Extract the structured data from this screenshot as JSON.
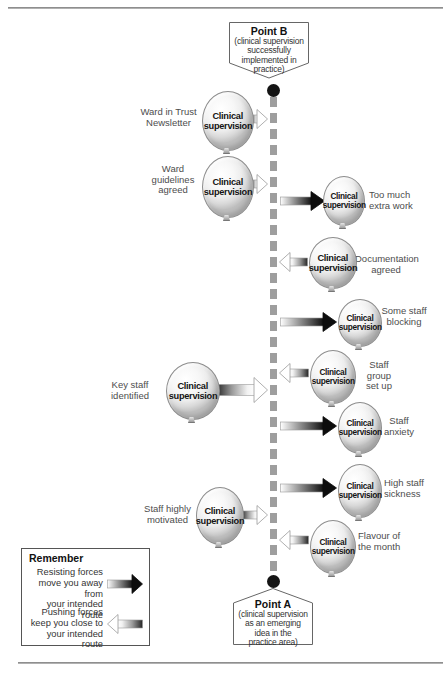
{
  "balloon_label": {
    "line1": "Clinical",
    "line2": "supervision"
  },
  "banners": {
    "point_b": {
      "title": "Point B",
      "lines": [
        "(clinical supervision",
        "successfully",
        "implemented in",
        "practice)"
      ]
    },
    "point_a": {
      "title": "Point A",
      "lines": [
        "(clinical supervision",
        "as an emerging",
        "idea in the",
        "practice area)"
      ]
    }
  },
  "legend": {
    "title": "Remember",
    "items": [
      {
        "text_lines": [
          "Resisting forces",
          "move you away from",
          "your intended route"
        ],
        "arrow": {
          "type": "resisting",
          "dir": "right"
        },
        "top": 18,
        "arrow_top": 25
      },
      {
        "text_lines": [
          "Pushing forces",
          "keep you close to",
          "your intended route"
        ],
        "arrow": {
          "type": "pushing",
          "dir": "left"
        },
        "top": 58,
        "arrow_top": 65
      }
    ]
  },
  "forces": [
    {
      "name": "ward-in-trust-newsletter",
      "type": "pushing",
      "side": "left",
      "label": [
        "Ward in Trust",
        "Newsletter"
      ],
      "label_box": {
        "left": 135,
        "top": 107,
        "width": 67,
        "align": "center"
      },
      "balloon": {
        "cx": 227,
        "cy": 120,
        "rx": 25,
        "ry": 29
      },
      "arrow": {
        "tail": 250,
        "tip": 268,
        "y": 119
      }
    },
    {
      "name": "ward-guidelines-agreed",
      "type": "pushing",
      "side": "left",
      "label": [
        "Ward",
        "guidelines",
        "agreed"
      ],
      "label_box": {
        "left": 145,
        "top": 164,
        "width": 56,
        "align": "center"
      },
      "balloon": {
        "cx": 227,
        "cy": 186,
        "rx": 25,
        "ry": 30
      },
      "arrow": {
        "tail": 250,
        "tip": 268,
        "y": 184
      }
    },
    {
      "name": "too-much-extra-work",
      "type": "resisting",
      "side": "right",
      "label": [
        "Too much",
        "extra work"
      ],
      "label_box": {
        "left": 369,
        "top": 190,
        "width": 50,
        "align": "left"
      },
      "balloon": {
        "cx": 343,
        "cy": 200,
        "rx": 20,
        "ry": 24
      },
      "arrow": {
        "tail": 280,
        "tip": 325,
        "y": 201
      }
    },
    {
      "name": "documentation-agreed",
      "type": "pushing",
      "side": "right",
      "label": [
        "Documentation",
        "agreed"
      ],
      "label_box": {
        "left": 355,
        "top": 254,
        "width": 62,
        "align": "center"
      },
      "balloon": {
        "cx": 332,
        "cy": 262,
        "rx": 23,
        "ry": 25
      },
      "arrow": {
        "tail": 308,
        "tip": 279,
        "y": 262
      }
    },
    {
      "name": "some-staff-blocking",
      "type": "resisting",
      "side": "right",
      "label": [
        "Some staff",
        "blocking"
      ],
      "label_box": {
        "left": 381,
        "top": 306,
        "width": 46,
        "align": "center"
      },
      "balloon": {
        "cx": 359,
        "cy": 322,
        "rx": 21,
        "ry": 23
      },
      "arrow": {
        "tail": 280,
        "tip": 337,
        "y": 322
      }
    },
    {
      "name": "staff-group-set-up",
      "type": "pushing",
      "side": "right",
      "label": [
        "Staff group",
        "set up"
      ],
      "label_box": {
        "left": 357,
        "top": 360,
        "width": 44,
        "align": "center"
      },
      "balloon": {
        "cx": 332,
        "cy": 376,
        "rx": 22,
        "ry": 26
      },
      "arrow": {
        "tail": 309,
        "tip": 279,
        "y": 373
      }
    },
    {
      "name": "key-staff-identified",
      "type": "pushing",
      "side": "left",
      "label": [
        "Key staff",
        "identified"
      ],
      "label_box": {
        "left": 104,
        "top": 380,
        "width": 52,
        "align": "center"
      },
      "balloon": {
        "cx": 192,
        "cy": 390,
        "rx": 26,
        "ry": 28
      },
      "arrow": {
        "tail": 216,
        "tip": 268,
        "y": 390,
        "h": 26
      }
    },
    {
      "name": "staff-anxiety",
      "type": "resisting",
      "side": "right",
      "label": [
        "Staff",
        "anxiety"
      ],
      "label_box": {
        "left": 383,
        "top": 416,
        "width": 32,
        "align": "center"
      },
      "balloon": {
        "cx": 359,
        "cy": 427,
        "rx": 21,
        "ry": 25
      },
      "arrow": {
        "tail": 280,
        "tip": 337,
        "y": 426
      }
    },
    {
      "name": "high-staff-sickness",
      "type": "resisting",
      "side": "right",
      "label": [
        "High staff",
        "sickness"
      ],
      "label_box": {
        "left": 384,
        "top": 478,
        "width": 46,
        "align": "left"
      },
      "balloon": {
        "cx": 359,
        "cy": 490,
        "rx": 21,
        "ry": 26
      },
      "arrow": {
        "tail": 280,
        "tip": 337,
        "y": 488
      }
    },
    {
      "name": "staff-highly-motivated",
      "type": "pushing",
      "side": "left",
      "label": [
        "Staff highly",
        "motivated"
      ],
      "label_box": {
        "left": 140,
        "top": 504,
        "width": 55,
        "align": "center"
      },
      "balloon": {
        "cx": 219,
        "cy": 515,
        "rx": 23,
        "ry": 28
      },
      "arrow": {
        "tail": 241,
        "tip": 268,
        "y": 515
      }
    },
    {
      "name": "flavour-of-the-month",
      "type": "pushing",
      "side": "right",
      "label": [
        "Flavour of",
        "the month"
      ],
      "label_box": {
        "left": 358,
        "top": 531,
        "width": 48,
        "align": "left"
      },
      "balloon": {
        "cx": 332,
        "cy": 546,
        "rx": 22,
        "ry": 26
      },
      "arrow": {
        "tail": 309,
        "tip": 279,
        "y": 540
      }
    }
  ],
  "colors": {
    "dashed_line": "#9e9e9e",
    "dot": "#141414",
    "resisting_head": "#0d0d0d",
    "pushing_head": "#ffffff",
    "arrow_outline": "#9a9a9a",
    "balloon_border": "#8d8d8d",
    "label_text": "#4d4d4d",
    "banner_border": "#666666"
  }
}
